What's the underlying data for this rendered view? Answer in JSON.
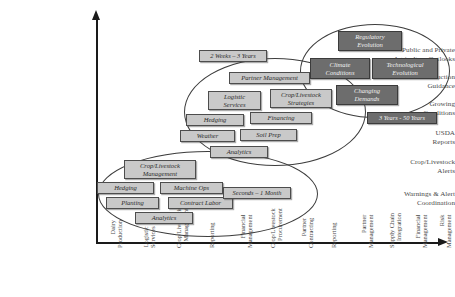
{
  "diagram": {
    "background": "#ffffff",
    "box_fill": "#c9c9c9",
    "box_dark_fill": "#6d6d6d",
    "axis_color": "#1a1a1a"
  },
  "y_axis": {
    "labels": [
      {
        "text": "Public and Private\nAgriculture Outlooks",
        "line1": "Public and Private",
        "line2": "Agriculture Outlooks"
      },
      {
        "text": "Production Guidance",
        "line1": "Production",
        "line2": "Guidance"
      },
      {
        "text": "Growing Conditions",
        "line1": "Growing",
        "line2": "Conditions"
      },
      {
        "text": "USDA Reports",
        "line1": "USDA",
        "line2": "Reports"
      },
      {
        "text": "Crop/Livestock Alerts",
        "line1": "Crop/Livestock",
        "line2": "Alerts"
      },
      {
        "text": "Warnings & Alert Coordination",
        "line1": "Warnings & Alert",
        "line2": "Coordination"
      }
    ]
  },
  "x_axis": {
    "labels": [
      {
        "line1": "Dairy",
        "line2": "Production"
      },
      {
        "line1": "Logistic",
        "line2": "Services"
      },
      {
        "line1": "Crop/Livestock",
        "line2": "Management"
      },
      {
        "line1": "Reporting",
        "line2": ""
      },
      {
        "line1": "Financial",
        "line2": "Management"
      },
      {
        "line1": "Crop/Livestock",
        "line2": "Procurement"
      },
      {
        "line1": "Partner",
        "line2": "Contracting"
      },
      {
        "line1": "Reporting",
        "line2": ""
      },
      {
        "line1": "Partner",
        "line2": "Management"
      },
      {
        "line1": "Supply Chain",
        "line2": "Integration"
      },
      {
        "line1": "Financial",
        "line2": "Management"
      },
      {
        "line1": "Risk",
        "line2": "Management"
      }
    ]
  },
  "clusters": [
    {
      "name": "short-term",
      "timeframe": "Seconds – 1 Month",
      "boxes": [
        "Crop/Livestock Management",
        "Hedging",
        "Machine Ops",
        "Planting",
        "Contract Labor",
        "Analytics"
      ]
    },
    {
      "name": "mid-term",
      "timeframe": "2 Weeks – 3 Years",
      "boxes": [
        "Partner Management",
        "Logistic Services",
        "Crop/Livestock Strategies",
        "Hedging",
        "Financing",
        "Weather",
        "Soil Prep",
        "Analytics"
      ]
    },
    {
      "name": "long-term",
      "timeframe": "3 Years - 50 Years",
      "boxes": [
        "Regulatory Evolution",
        "Climate Conditions",
        "Technological Evolution",
        "Changing Demands"
      ]
    }
  ],
  "boxes": {
    "b_crop_mgmt_1": {
      "line1": "Crop/Livestock",
      "line2": "Management"
    },
    "b_hedging_1": {
      "line1": "Hedging",
      "line2": ""
    },
    "b_machine_ops": {
      "line1": "Machine Ops",
      "line2": ""
    },
    "b_planting": {
      "line1": "Planting",
      "line2": ""
    },
    "b_contract_labor": {
      "line1": "Contract Labor",
      "line2": ""
    },
    "b_analytics_1": {
      "line1": "Analytics",
      "line2": ""
    },
    "b_partner_mgmt": {
      "line1": "Partner Management",
      "line2": ""
    },
    "b_logistic_services": {
      "line1": "Logistic",
      "line2": "Services"
    },
    "b_crop_strategies": {
      "line1": "Crop/Livestock",
      "line2": "Strategies"
    },
    "b_hedging_2": {
      "line1": "Hedging",
      "line2": ""
    },
    "b_financing": {
      "line1": "Financing",
      "line2": ""
    },
    "b_weather": {
      "line1": "Weather",
      "line2": ""
    },
    "b_soil_prep": {
      "line1": "Soil Prep",
      "line2": ""
    },
    "b_analytics_2": {
      "line1": "Analytics",
      "line2": ""
    },
    "b_regulatory": {
      "line1": "Regulatory",
      "line2": "Evolution"
    },
    "b_climate": {
      "line1": "Climate",
      "line2": "Conditions"
    },
    "b_technological": {
      "line1": "Technological",
      "line2": "Evolution"
    },
    "b_changing_demands": {
      "line1": "Changing",
      "line2": "Demands"
    }
  },
  "tags": {
    "t_short": "Seconds – 1 Month",
    "t_mid": "2 Weeks – 3 Years",
    "t_long": "3 Years - 50 Years"
  }
}
